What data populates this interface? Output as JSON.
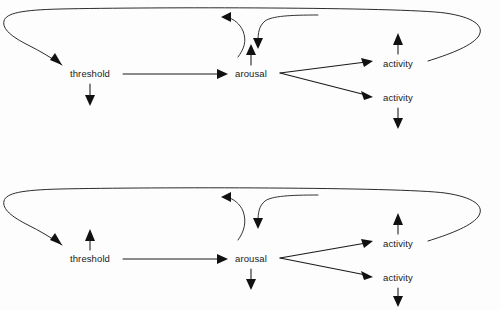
{
  "figure": {
    "background_color": "#fdfdfd",
    "line_color": "#1a1a1a",
    "text_color": "#1a1a1a",
    "panel_count": 2
  },
  "panels": [
    {
      "id": "upper-panel",
      "name": "increase-arousal-panel",
      "nodes": [
        {
          "key": "threshold",
          "label": "threshold",
          "x": 90,
          "y": 77,
          "modifier": "down-arrow-below",
          "modifier_direction": "down"
        },
        {
          "key": "arousal",
          "label": "arousal",
          "x": 251,
          "y": 77,
          "modifier": "up-arrow-above",
          "modifier_direction": "up"
        },
        {
          "key": "activity-upper",
          "label": "activity",
          "x": 398,
          "y": 67,
          "modifier": "up-arrow-above",
          "modifier_direction": "up"
        },
        {
          "key": "activity-lower",
          "label": "activity",
          "x": 398,
          "y": 101,
          "modifier": "down-arrow-below",
          "modifier_direction": "down"
        }
      ],
      "edges": [
        {
          "key": "threshold-to-arousal",
          "from": "threshold",
          "to": "arousal",
          "style": "straight"
        },
        {
          "key": "arousal-to-activity-upper",
          "from": "arousal",
          "to": "activity-upper",
          "style": "straight"
        },
        {
          "key": "arousal-to-activity-lower",
          "from": "arousal",
          "to": "activity-lower",
          "style": "straight"
        },
        {
          "key": "feedback-loop-to-threshold",
          "from": "activity-upper",
          "to": "threshold",
          "style": "long-loop"
        },
        {
          "key": "inhibition-into-arousal",
          "from": "activity-upper",
          "to": "arousal",
          "style": "hooked-curve"
        },
        {
          "key": "arousal-rebound-out",
          "from": "arousal",
          "to": "loop",
          "style": "s-curve"
        }
      ]
    },
    {
      "id": "lower-panel",
      "name": "decrease-arousal-panel",
      "nodes": [
        {
          "key": "threshold",
          "label": "threshold",
          "x": 90,
          "y": 262,
          "modifier": "up-arrow-above",
          "modifier_direction": "up"
        },
        {
          "key": "arousal",
          "label": "arousal",
          "x": 251,
          "y": 262,
          "modifier": "down-arrow-below",
          "modifier_direction": "down"
        },
        {
          "key": "activity-upper",
          "label": "activity",
          "x": 398,
          "y": 247,
          "modifier": "up-arrow-above",
          "modifier_direction": "up"
        },
        {
          "key": "activity-lower",
          "label": "activity",
          "x": 398,
          "y": 281,
          "modifier": "down-arrow-below",
          "modifier_direction": "down"
        }
      ],
      "edges": [
        {
          "key": "threshold-to-arousal",
          "from": "threshold",
          "to": "arousal",
          "style": "straight"
        },
        {
          "key": "arousal-to-activity-upper",
          "from": "arousal",
          "to": "activity-upper",
          "style": "straight"
        },
        {
          "key": "arousal-to-activity-lower",
          "from": "arousal",
          "to": "activity-lower",
          "style": "straight"
        },
        {
          "key": "feedback-loop-to-threshold",
          "from": "activity-upper",
          "to": "threshold",
          "style": "long-loop"
        },
        {
          "key": "inhibition-into-arousal",
          "from": "activity-upper",
          "to": "arousal",
          "style": "hooked-curve"
        },
        {
          "key": "arousal-rebound-out",
          "from": "arousal",
          "to": "loop",
          "style": "s-curve"
        }
      ]
    }
  ],
  "labels": {
    "threshold": "threshold",
    "arousal": "arousal",
    "activity": "activity"
  }
}
